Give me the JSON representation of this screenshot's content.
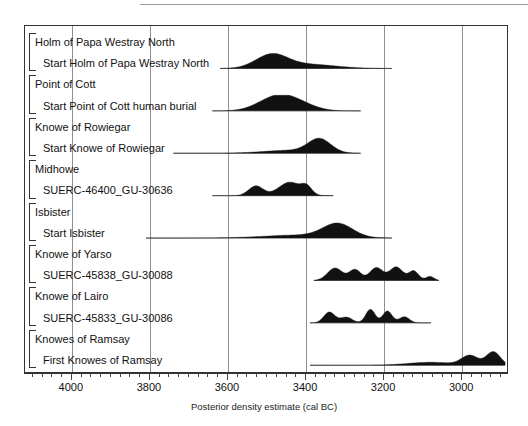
{
  "chart_data": {
    "type": "area",
    "title": "",
    "xlabel": "Posterior density estimate (cal BC)",
    "ylabel": "",
    "xlim": [
      4120,
      2880
    ],
    "x_reversed": true,
    "grid": true,
    "legend": false,
    "tick_labels": [
      "4000",
      "3800",
      "3600",
      "3400",
      "3200",
      "3000"
    ],
    "tick_values": [
      4000,
      3800,
      3600,
      3400,
      3200,
      3000
    ],
    "minor_tick_step": 25,
    "groups": [
      {
        "group_label": "Holm of Papa Westray North",
        "items": [
          {
            "label": "Start Holm of Papa Westray North",
            "range_start": 3620,
            "range_end": 3180,
            "mode": 3490,
            "shape": "unimodal-right-tail"
          }
        ]
      },
      {
        "group_label": "Point of Cott",
        "items": [
          {
            "label": "Start Point of Cott human burial",
            "range_start": 3640,
            "range_end": 3260,
            "mode": 3480,
            "shape": "unimodal-broad"
          }
        ]
      },
      {
        "group_label": "Knowe of Rowiegar",
        "items": [
          {
            "label": "Start Knowe of Rowiegar",
            "range_start": 3740,
            "range_end": 3260,
            "mode": 3385,
            "shape": "unimodal-left-tail"
          }
        ]
      },
      {
        "group_label": "Midhowe",
        "items": [
          {
            "label": "SUERC-46400_GU-30636",
            "range_start": 3640,
            "range_end": 3330,
            "mode": 3390,
            "shape": "bimodal"
          }
        ]
      },
      {
        "group_label": "Isbister",
        "items": [
          {
            "label": "Start Isbister",
            "range_start": 3810,
            "range_end": 3180,
            "mode": 3330,
            "shape": "unimodal-left-tail"
          }
        ]
      },
      {
        "group_label": "Knowe of Yarso",
        "items": [
          {
            "label": "SUERC-45838_GU-30088",
            "range_start": 3380,
            "range_end": 3060,
            "mode": 3260,
            "shape": "multimodal-plateau"
          }
        ]
      },
      {
        "group_label": "Knowe of Lairo",
        "items": [
          {
            "label": "SUERC-45833_GU-30086",
            "range_start": 3390,
            "range_end": 3080,
            "mode": 3200,
            "shape": "multimodal"
          }
        ]
      },
      {
        "group_label": "Knowes of Ramsay",
        "items": [
          {
            "label": "First Knowes of Ramsay",
            "range_start": 3390,
            "range_end": 2890,
            "mode": 2930,
            "shape": "rising-right"
          }
        ]
      }
    ]
  },
  "axis": {
    "title": "Posterior density estimate (cal BC)",
    "ticks": [
      "4000",
      "3800",
      "3600",
      "3400",
      "3200",
      "3000"
    ]
  },
  "colors": {
    "distribution_fill": "#111111",
    "gridline": "#8f8f8f",
    "frame": "#333333",
    "baseline": "#8a8a8a",
    "text": "#111111"
  }
}
